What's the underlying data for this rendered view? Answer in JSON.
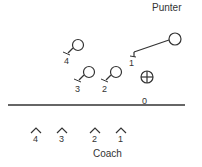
{
  "diagram": {
    "colors": {
      "stroke": "#333333",
      "background": "#ffffff"
    },
    "labels": {
      "punter": "Punter",
      "coach": "Coach",
      "ball": "0"
    },
    "players": [
      {
        "number": "1",
        "role": "upback-with-route-to-punter"
      },
      {
        "number": "2",
        "role": "lineman"
      },
      {
        "number": "3",
        "role": "lineman"
      },
      {
        "number": "4",
        "role": "lineman"
      }
    ],
    "defenders": [
      {
        "number": "4"
      },
      {
        "number": "3"
      },
      {
        "number": "2"
      },
      {
        "number": "1"
      }
    ],
    "symbols": {
      "snapper": "crossed-circle",
      "line_of_scrimmage": "horizontal-line"
    }
  }
}
